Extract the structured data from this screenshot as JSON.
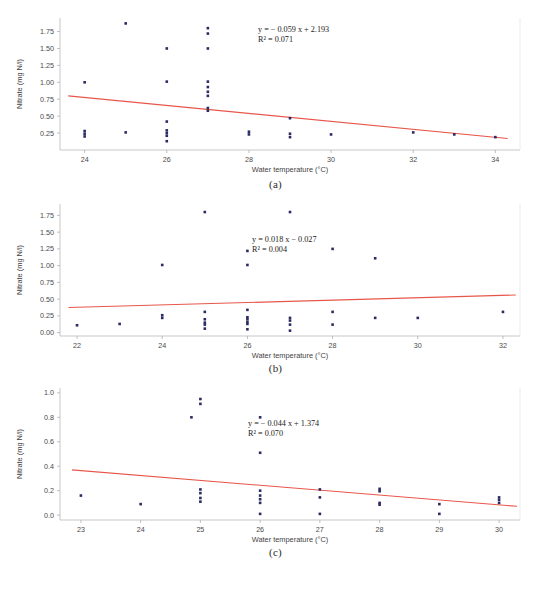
{
  "figure": {
    "axis_labels": {
      "x": "Water temperature (°C)",
      "y": "Nitrate (mg N/l)"
    },
    "colors": {
      "points": "#2b2b63",
      "trendline": "#e8564a",
      "axis": "#b9b9b9",
      "text": "#3a3a3a"
    }
  },
  "chart_data": [
    {
      "type": "scatter",
      "panel": "(a)",
      "title": "",
      "xlabel": "Water temperature (°C)",
      "ylabel": "Nitrate (mg N/l)",
      "xlim": [
        23.4,
        34.6
      ],
      "ylim": [
        0.0,
        1.95
      ],
      "xticks": [
        24,
        26,
        28,
        30,
        32,
        34
      ],
      "yticks": [
        0.25,
        0.5,
        0.75,
        1.0,
        1.25,
        1.5,
        1.75
      ],
      "ytick_labels": [
        "0.25",
        "0.50",
        "0.75",
        "1.00",
        "1.25",
        "1.50",
        "1.75"
      ],
      "grid": false,
      "annotation_equation": "y = − 0.059 x + 2.193",
      "annotation_r2": "R² = 0.071",
      "fit": {
        "slope": -0.059,
        "intercept": 2.193,
        "r2": 0.071
      },
      "trendline_endpoints": [
        [
          23.6,
          0.8
        ],
        [
          34.3,
          0.169
        ]
      ],
      "points": [
        [
          24,
          1.0
        ],
        [
          24,
          0.28
        ],
        [
          24,
          0.24
        ],
        [
          24,
          0.2
        ],
        [
          25,
          1.87
        ],
        [
          25,
          0.26
        ],
        [
          26,
          1.5
        ],
        [
          26,
          1.01
        ],
        [
          26,
          0.42
        ],
        [
          26,
          0.29
        ],
        [
          26,
          0.25
        ],
        [
          26,
          0.21
        ],
        [
          26,
          0.13
        ],
        [
          27,
          1.8
        ],
        [
          27,
          1.72
        ],
        [
          27,
          1.5
        ],
        [
          27,
          1.01
        ],
        [
          27,
          0.93
        ],
        [
          27,
          0.86
        ],
        [
          27,
          0.8
        ],
        [
          27,
          0.62
        ],
        [
          27,
          0.58
        ],
        [
          28,
          0.27
        ],
        [
          28,
          0.23
        ],
        [
          29,
          0.47
        ],
        [
          29,
          0.24
        ],
        [
          29,
          0.19
        ],
        [
          30,
          0.23
        ],
        [
          32,
          0.26
        ],
        [
          33,
          0.23
        ],
        [
          34,
          0.19
        ]
      ]
    },
    {
      "type": "scatter",
      "panel": "(b)",
      "title": "",
      "xlabel": "Water temperature (°C)",
      "ylabel": "Nitrate (mg N/l)",
      "xlim": [
        21.6,
        32.4
      ],
      "ylim": [
        -0.05,
        1.92
      ],
      "xticks": [
        22,
        24,
        26,
        28,
        30,
        32
      ],
      "yticks": [
        0.0,
        0.25,
        0.5,
        0.75,
        1.0,
        1.25,
        1.5,
        1.75
      ],
      "ytick_labels": [
        "0.00",
        "0.25",
        "0.50",
        "0.75",
        "1.00",
        "1.25",
        "1.50",
        "1.75"
      ],
      "grid": false,
      "annotation_equation": "y = 0.018 x − 0.027",
      "annotation_r2": "R² = 0.004",
      "fit": {
        "slope": 0.018,
        "intercept": -0.027,
        "r2": 0.004
      },
      "trendline_endpoints": [
        [
          21.8,
          0.375
        ],
        [
          32.3,
          0.562
        ]
      ],
      "points": [
        [
          22,
          0.11
        ],
        [
          23,
          0.13
        ],
        [
          24,
          1.01
        ],
        [
          24,
          0.26
        ],
        [
          24,
          0.22
        ],
        [
          25,
          1.8
        ],
        [
          25,
          0.31
        ],
        [
          25,
          0.2
        ],
        [
          25,
          0.15
        ],
        [
          25,
          0.12
        ],
        [
          25,
          0.06
        ],
        [
          26,
          1.22
        ],
        [
          26,
          1.01
        ],
        [
          26,
          0.34
        ],
        [
          26,
          0.23
        ],
        [
          26,
          0.2
        ],
        [
          26,
          0.16
        ],
        [
          26,
          0.13
        ],
        [
          26,
          0.05
        ],
        [
          27,
          1.8
        ],
        [
          27,
          0.22
        ],
        [
          27,
          0.18
        ],
        [
          27,
          0.12
        ],
        [
          27,
          0.03
        ],
        [
          28,
          1.25
        ],
        [
          28,
          0.31
        ],
        [
          28,
          0.12
        ],
        [
          29,
          1.11
        ],
        [
          29,
          0.22
        ],
        [
          30,
          0.22
        ],
        [
          32,
          0.31
        ]
      ]
    },
    {
      "type": "scatter",
      "panel": "(c)",
      "title": "",
      "xlabel": "Water temperature (°C)",
      "ylabel": "Nitrate (mg N/l)",
      "xlim": [
        22.65,
        30.35
      ],
      "ylim": [
        -0.04,
        1.04
      ],
      "xticks": [
        23,
        24,
        25,
        26,
        27,
        28,
        29,
        30
      ],
      "yticks": [
        0.0,
        0.2,
        0.4,
        0.6,
        0.8,
        1.0
      ],
      "ytick_labels": [
        "0.0",
        "0.2",
        "0.4",
        "0.6",
        "0.8",
        "1.0"
      ],
      "grid": false,
      "annotation_equation": "y = − 0.044 x + 1.374",
      "annotation_r2": "R² = 0.070",
      "fit": {
        "slope": -0.044,
        "intercept": 1.374,
        "r2": 0.07
      },
      "trendline_endpoints": [
        [
          22.85,
          0.37
        ],
        [
          30.3,
          0.072
        ]
      ],
      "points": [
        [
          23,
          0.16
        ],
        [
          24,
          0.09
        ],
        [
          24.85,
          0.8
        ],
        [
          25,
          0.95
        ],
        [
          25,
          0.91
        ],
        [
          25,
          0.21
        ],
        [
          25,
          0.18
        ],
        [
          25,
          0.14
        ],
        [
          25,
          0.11
        ],
        [
          26,
          0.8
        ],
        [
          26,
          0.51
        ],
        [
          26,
          0.2
        ],
        [
          26,
          0.16
        ],
        [
          26,
          0.13
        ],
        [
          26,
          0.1
        ],
        [
          26,
          0.01
        ],
        [
          27,
          0.21
        ],
        [
          27,
          0.145
        ],
        [
          27,
          0.01
        ],
        [
          28,
          0.215
        ],
        [
          28,
          0.195
        ],
        [
          28,
          0.1
        ],
        [
          28,
          0.085
        ],
        [
          29,
          0.09
        ],
        [
          29,
          0.01
        ],
        [
          30,
          0.145
        ],
        [
          30,
          0.125
        ],
        [
          30,
          0.1
        ]
      ]
    }
  ]
}
